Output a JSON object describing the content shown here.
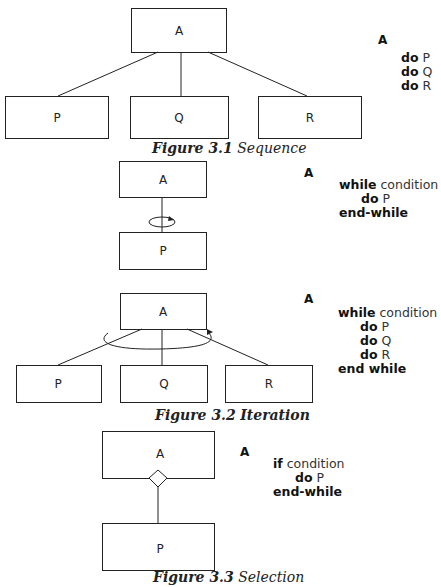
{
  "figures": [
    {
      "id": "3.1",
      "caption": {
        "number": "Figure 3.1",
        "title": "Sequence"
      },
      "parent": "A",
      "children": [
        "P",
        "Q",
        "R"
      ],
      "pseudocode": {
        "header": "A",
        "lines": [
          {
            "kw": "do",
            "arg": "P"
          },
          {
            "kw": "do",
            "arg": "Q"
          },
          {
            "kw": "do",
            "arg": "R"
          }
        ]
      }
    },
    {
      "id": "3.2a",
      "parent": "A",
      "children": [
        "P"
      ],
      "pseudocode": {
        "header": "A",
        "lines": [
          {
            "kw": "while",
            "arg": "condition"
          },
          {
            "kw": "do",
            "arg": "P"
          },
          {
            "kw": "end-while",
            "arg": ""
          }
        ]
      }
    },
    {
      "id": "3.2b",
      "caption": {
        "number": "Figure 3.2",
        "title": "Iteration"
      },
      "parent": "A",
      "children": [
        "P",
        "Q",
        "R"
      ],
      "pseudocode": {
        "header": "A",
        "lines": [
          {
            "kw": "while",
            "arg": "condition"
          },
          {
            "kw": "do",
            "arg": "P"
          },
          {
            "kw": "do",
            "arg": "Q"
          },
          {
            "kw": "do",
            "arg": "R"
          },
          {
            "kw": "end while",
            "arg": ""
          }
        ]
      }
    },
    {
      "id": "3.3",
      "caption": {
        "number": "Figure 3.3",
        "title": "Selection"
      },
      "parent": "A",
      "children": [
        "P"
      ],
      "pseudocode": {
        "header": "A",
        "lines": [
          {
            "kw": "if",
            "arg": "condition"
          },
          {
            "kw": "do",
            "arg": "P"
          },
          {
            "kw": "end-while",
            "arg": ""
          }
        ]
      }
    }
  ]
}
